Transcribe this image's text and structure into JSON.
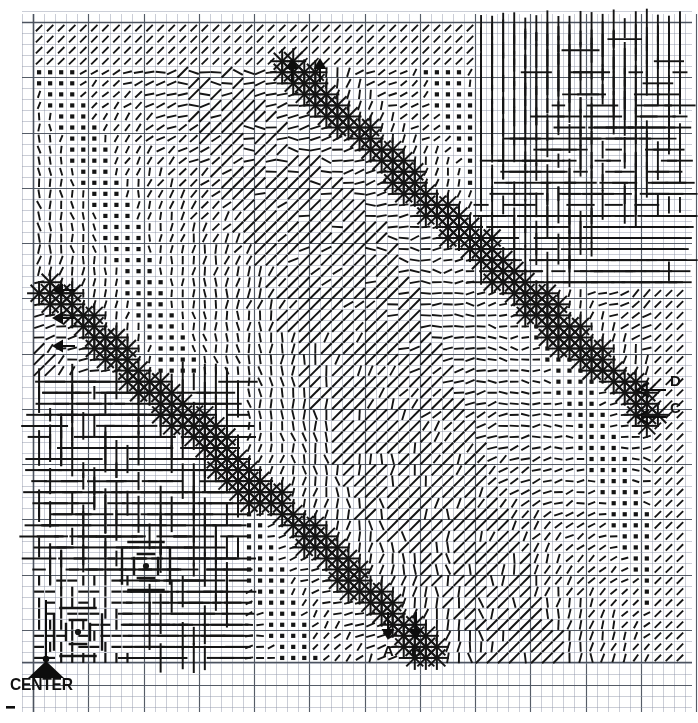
{
  "figure": {
    "kind": "scanned-technical-plot",
    "medium": "graph-paper",
    "title": "",
    "background_color": "#ffffff",
    "ink_color": "#141414",
    "grid_minor_color": "#8f96a8",
    "grid_major_color": "#4c535f",
    "grid_minor_spacing_px": 11.05,
    "grid_major_every": 5,
    "plot_area": {
      "x": 33,
      "y": 22,
      "width": 652,
      "height": 640
    }
  },
  "annotations": {
    "labels": [
      {
        "id": "label-a",
        "text": "A",
        "x": 383,
        "y": 655,
        "marker": "down-arrow",
        "marker_x": 388,
        "marker_y": 628,
        "size": "ab"
      },
      {
        "id": "label-b",
        "text": "B",
        "x": 411,
        "y": 655,
        "marker": "down-arrow",
        "marker_x": 416,
        "marker_y": 628,
        "size": "ab"
      },
      {
        "id": "label-c",
        "text": "C",
        "x": 670,
        "y": 412,
        "marker": "left-arrow",
        "marker_x": 640,
        "marker_y": 417,
        "size": "cd"
      },
      {
        "id": "label-d",
        "text": "D",
        "x": 670,
        "y": 385,
        "marker": "left-arrow",
        "marker_x": 640,
        "marker_y": 390,
        "size": "cd"
      },
      {
        "id": "label-center",
        "text": "CENTER",
        "x": 10,
        "y": 688,
        "marker": "pointer-up",
        "marker_x": 46,
        "marker_y": 662,
        "size": "center"
      }
    ],
    "edge_arrows": [
      {
        "dir": "left",
        "x": 60,
        "y": 290
      },
      {
        "dir": "left",
        "x": 60,
        "y": 318
      },
      {
        "dir": "left",
        "x": 60,
        "y": 345
      },
      {
        "dir": "up",
        "x": 292,
        "y": 62
      },
      {
        "dir": "up",
        "x": 320,
        "y": 62
      },
      {
        "dir": "down",
        "x": 388,
        "y": 628
      },
      {
        "dir": "down",
        "x": 416,
        "y": 628
      }
    ]
  },
  "chart_data": {
    "type": "scatter",
    "title": "",
    "xlabel": "",
    "ylabel": "",
    "grid": true,
    "legend": "none",
    "xlim": [
      33,
      685
    ],
    "ylim": [
      22,
      662
    ],
    "glyph_types": [
      {
        "name": "asterisk",
        "meaning": "maximum amplitude sample",
        "rays": 8,
        "radius_px": 13
      },
      {
        "name": "tick",
        "meaning": "oriented small sample",
        "length_px": 9
      },
      {
        "name": "dot-square",
        "meaning": "near-zero sample",
        "size_px": 4
      },
      {
        "name": "rule-h",
        "meaning": "horizontal extended run"
      },
      {
        "name": "rule-v",
        "meaning": "vertical extended run"
      },
      {
        "name": "bullseye",
        "meaning": "concentric-square origin marker"
      }
    ],
    "features": [
      {
        "name": "upper ridge",
        "path": "from (295,70) descending to (640,400)"
      },
      {
        "name": "lower ridge",
        "path": "from (55,300) descending to (420,640)"
      },
      {
        "name": "center-marker",
        "x": 46,
        "y": 635
      }
    ]
  }
}
